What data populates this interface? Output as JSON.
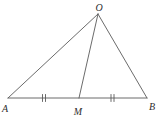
{
  "figure": {
    "type": "geometry-diagram",
    "labels": {
      "apex": "O",
      "left_vertex": "A",
      "right_vertex": "B",
      "base_point": "M"
    },
    "colors": {
      "line": "#5a5a5a",
      "label": "#2e2e2e",
      "background": "#ffffff"
    }
  }
}
